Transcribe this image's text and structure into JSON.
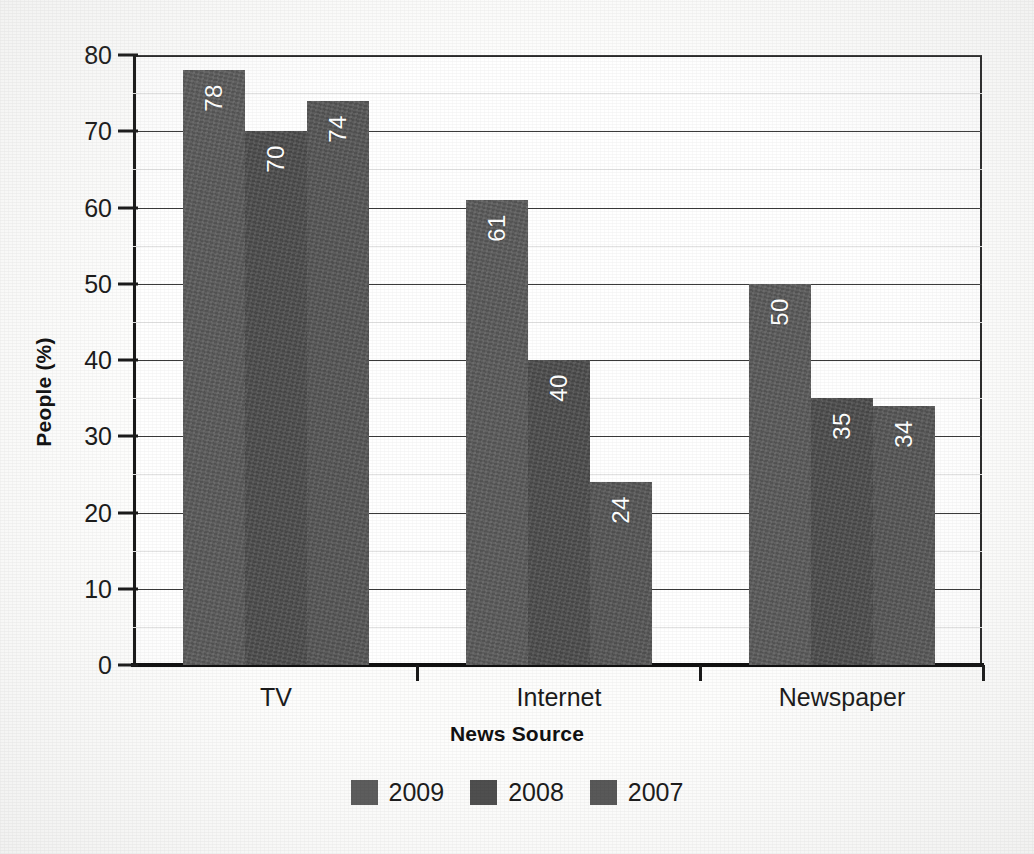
{
  "chart_data": {
    "type": "bar",
    "title": "",
    "subtitle": "",
    "xlabel": "News Source",
    "ylabel": "People (%)",
    "categories": [
      "TV",
      "Internet",
      "Newspaper"
    ],
    "series": [
      {
        "name": "2009",
        "values": [
          78,
          61,
          50
        ],
        "color": "#5c5c5c"
      },
      {
        "name": "2008",
        "values": [
          70,
          40,
          35
        ],
        "color": "#4e4e4e"
      },
      {
        "name": "2007",
        "values": [
          74,
          24,
          34
        ],
        "color": "#585858"
      }
    ],
    "ylim": [
      0,
      80
    ],
    "yticks": [
      0,
      10,
      20,
      30,
      40,
      50,
      60,
      70,
      80
    ],
    "ytick_labels": [
      "0",
      "10",
      "20",
      "30",
      "40",
      "50",
      "60",
      "70",
      "80"
    ],
    "minor_yticks": [
      5,
      15,
      25,
      35,
      45,
      55,
      65,
      75
    ],
    "grid": "horizontal-major-and-minor",
    "legend_position": "bottom-center",
    "value_labels": "inside-top-rotated-vertical",
    "value_label_color": "#ffffff",
    "bar_grouping": "clustered-adjacent",
    "axis_color": "#1a1a1a",
    "plot_background": "#ffffff",
    "page_background": "#fdfdfc"
  },
  "axes": {
    "y": {
      "label": "People (%)",
      "ticks": [
        {
          "value": 80,
          "label": "80"
        },
        {
          "value": 70,
          "label": "70"
        },
        {
          "value": 60,
          "label": "60"
        },
        {
          "value": 50,
          "label": "50"
        },
        {
          "value": 40,
          "label": "40"
        },
        {
          "value": 30,
          "label": "30"
        },
        {
          "value": 20,
          "label": "20"
        },
        {
          "value": 10,
          "label": "10"
        },
        {
          "value": 0,
          "label": "0"
        }
      ]
    },
    "x": {
      "label": "News Source",
      "ticks": [
        {
          "label": "TV"
        },
        {
          "label": "Internet"
        },
        {
          "label": "Newspaper"
        }
      ]
    }
  },
  "legend": {
    "items": [
      {
        "label": "2009",
        "color": "#5c5c5c"
      },
      {
        "label": "2008",
        "color": "#4e4e4e"
      },
      {
        "label": "2007",
        "color": "#585858"
      }
    ]
  }
}
